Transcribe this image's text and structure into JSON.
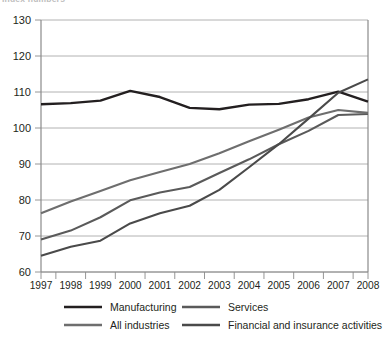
{
  "title_partial": "Index numbers",
  "chart_data": {
    "type": "line",
    "title": "",
    "xlabel": "",
    "ylabel": "",
    "x": [
      1997,
      1998,
      1999,
      2000,
      2001,
      2002,
      2003,
      2004,
      2005,
      2006,
      2007,
      2008
    ],
    "xticklabels": [
      "1997",
      "1998",
      "1999",
      "2000",
      "2001",
      "2002",
      "2003",
      "2004",
      "2005",
      "2006",
      "2007",
      "2008"
    ],
    "yticklabels": [
      "60",
      "70",
      "80",
      "90",
      "100",
      "110",
      "120",
      "130"
    ],
    "yticks": [
      60,
      70,
      80,
      90,
      100,
      110,
      120,
      130
    ],
    "ylim": [
      60,
      130
    ],
    "xlim": [
      1997,
      2008
    ],
    "grid": "horizontal",
    "legend_position": "bottom",
    "series": [
      {
        "name": "Manufacturing",
        "color": "#231f20",
        "width": 2.4,
        "values": [
          106.6,
          106.9,
          107.6,
          110.3,
          108.6,
          105.6,
          105.2,
          106.5,
          106.7,
          108.0,
          110.1,
          107.3
        ]
      },
      {
        "name": "Services",
        "color": "#5a5a5a",
        "width": 2.1,
        "values": [
          69.0,
          71.5,
          75.2,
          79.9,
          82.1,
          83.6,
          87.5,
          91.3,
          95.5,
          99.2,
          103.6,
          103.9
        ]
      },
      {
        "name": "All industries",
        "color": "#6e6e6e",
        "width": 2.1,
        "values": [
          76.3,
          79.6,
          82.5,
          85.5,
          87.8,
          90.0,
          93.0,
          96.3,
          99.5,
          102.9,
          105.0,
          104.2
        ]
      },
      {
        "name": "Financial and insurance activities",
        "color": "#4a4a4a",
        "width": 2.1,
        "values": [
          64.5,
          67.0,
          68.7,
          73.5,
          76.3,
          78.4,
          82.8,
          89.1,
          95.5,
          102.6,
          109.8,
          113.5
        ]
      }
    ]
  },
  "legend": {
    "entries": [
      {
        "label": "Manufacturing",
        "color": "#231f20"
      },
      {
        "label": "Services",
        "color": "#5a5a5a"
      },
      {
        "label": "All industries",
        "color": "#6e6e6e"
      },
      {
        "label": "Financial and insurance activities",
        "color": "#4a4a4a"
      }
    ]
  }
}
